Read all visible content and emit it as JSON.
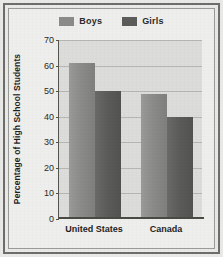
{
  "chart_data": {
    "type": "bar",
    "title": "",
    "xlabel": "",
    "ylabel": "Percentage of High School Students",
    "categories": [
      "United States",
      "Canada"
    ],
    "series": [
      {
        "name": "Boys",
        "color": "#8b8b89",
        "values": [
          61,
          49
        ]
      },
      {
        "name": "Girls",
        "color": "#5c5c5a",
        "values": [
          50,
          40
        ]
      }
    ],
    "ylim": [
      0,
      70
    ],
    "ytick_step": 10,
    "yticks": [
      0,
      10,
      20,
      30,
      40,
      50,
      60,
      70
    ],
    "ytick_labels": [
      "0",
      "10",
      "20",
      "30",
      "40",
      "50",
      "60",
      "70"
    ],
    "grid": true,
    "grid_axis": "y",
    "legend_position": "top-center"
  },
  "legend": {
    "items": [
      {
        "label": "Boys",
        "swatch_name": "legend-swatch-boys"
      },
      {
        "label": "Girls",
        "swatch_name": "legend-swatch-girls"
      }
    ]
  },
  "colors": {
    "boys": "#8b8b89",
    "girls": "#5c5c5a",
    "plot_background": "#dcdcda",
    "figure_background": "#eeeeec",
    "frame": "#6d6d6b",
    "gridline": "#b6b6b2",
    "axis": "#4a4a45",
    "text": "#1f1f1f"
  }
}
